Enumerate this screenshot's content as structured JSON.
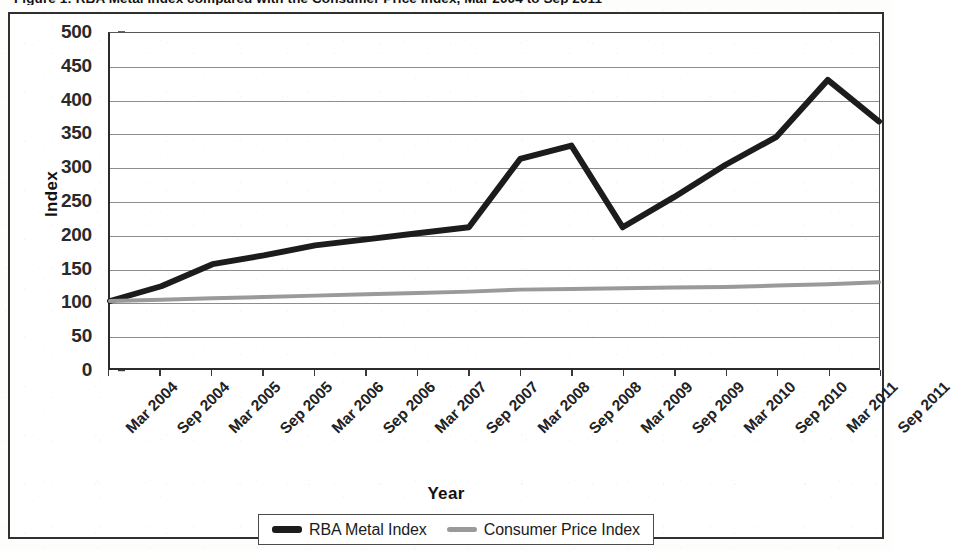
{
  "figure": {
    "caption": "Figure 1: RBA Metal Index compared with the Consumer Price Index, Mar 2004 to Sep 2011"
  },
  "axes": {
    "y_title": "Index",
    "x_title": "Year",
    "y_ticks": [
      "500",
      "450",
      "400",
      "350",
      "300",
      "250",
      "200",
      "150",
      "100",
      "50",
      "0"
    ]
  },
  "legend": {
    "items": [
      {
        "label": "RBA Metal Index",
        "swatch": "thick-dark-line-swatch",
        "color": "#1c1c1c"
      },
      {
        "label": "Consumer Price Index",
        "swatch": "thin-gray-line-swatch",
        "color": "#9a9a9a"
      }
    ]
  },
  "chart_data": {
    "type": "line",
    "title": "RBA Metal Index compared with the Consumer Price Index",
    "xlabel": "Year",
    "ylabel": "Index",
    "ylim": [
      0,
      500
    ],
    "ytick_step": 50,
    "grid": true,
    "legend_position": "bottom",
    "categories": [
      "Mar 2004",
      "Sep 2004",
      "Mar 2005",
      "Sep 2005",
      "Mar 2006",
      "Sep 2006",
      "Mar 2007",
      "Sep 2007",
      "Mar 2008",
      "Sep 2008",
      "Mar 2009",
      "Sep 2009",
      "Mar 2010",
      "Sep 2010",
      "Mar 2011",
      "Sep 2011"
    ],
    "series": [
      {
        "name": "RBA Metal Index",
        "color": "#1c1c1c",
        "width": 6,
        "values": [
          100,
          122,
          155,
          168,
          183,
          192,
          201,
          210,
          312,
          332,
          210,
          255,
          303,
          345,
          430,
          368
        ]
      },
      {
        "name": "Consumer Price Index",
        "color": "#9a9a9a",
        "width": 4,
        "values": [
          100,
          102,
          104,
          106,
          108,
          110,
          112,
          114,
          117,
          118,
          119,
          120,
          121,
          123,
          125,
          128
        ]
      }
    ],
    "annotations": [
      {
        "text": "peak 332 at Sep 2008"
      },
      {
        "text": "trough 210 at Mar 2009"
      },
      {
        "text": "peak 435 between Mar 2011 and Sep 2011"
      }
    ]
  }
}
